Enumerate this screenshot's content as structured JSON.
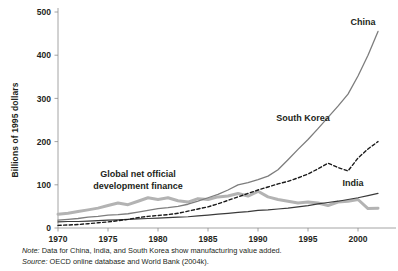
{
  "figure": {
    "axis_color": "#8d8d8d",
    "text_color": "#231f20"
  },
  "notes": {
    "note_key": "Note:",
    "note_text": " Data for China, India, and South Korea show manufacturing value added.",
    "source_key": "Source:",
    "source_text": " OECD online database and World Bank (2004k)."
  },
  "annotation": {
    "line1": "Global net official",
    "line2": "development finance"
  },
  "chart_data": {
    "type": "line",
    "title": "",
    "subtitle": "",
    "xlabel": "",
    "ylabel": "Billions of 1995 dollars",
    "xlim": [
      1970,
      2002
    ],
    "ylim": [
      0,
      500
    ],
    "yticks": [
      0,
      100,
      200,
      300,
      400,
      500
    ],
    "ytick_labels": [
      "0",
      "100",
      "200",
      "300",
      "400",
      "500"
    ],
    "xticks": [
      1970,
      1975,
      1980,
      1985,
      1990,
      1995,
      2000
    ],
    "xtick_labels": [
      "1970",
      "1975",
      "1980",
      "1985",
      "1990",
      "1995",
      "2000"
    ],
    "grid": false,
    "legend": "inline-labels",
    "x": [
      1970,
      1971,
      1972,
      1973,
      1974,
      1975,
      1976,
      1977,
      1978,
      1979,
      1980,
      1981,
      1982,
      1983,
      1984,
      1985,
      1986,
      1987,
      1988,
      1989,
      1990,
      1991,
      1992,
      1993,
      1994,
      1995,
      1996,
      1997,
      1998,
      1999,
      2000,
      2001,
      2002
    ],
    "series": [
      {
        "name": "China",
        "label": "China",
        "color": "#7d7d7d",
        "style": "solid",
        "width": 1.3,
        "label_xy": [
          2000.5,
          470
        ],
        "values": [
          18,
          20,
          22,
          25,
          27,
          30,
          31,
          33,
          37,
          41,
          45,
          47,
          50,
          55,
          62,
          70,
          78,
          88,
          100,
          105,
          112,
          120,
          135,
          158,
          182,
          205,
          230,
          256,
          282,
          310,
          352,
          400,
          455
        ]
      },
      {
        "name": "South Korea",
        "label": "South Korea",
        "color": "#1a1a1a",
        "style": "dashed",
        "width": 1.4,
        "label_xy": [
          1994.5,
          247
        ],
        "values": [
          6,
          7,
          8,
          10,
          12,
          14,
          17,
          20,
          24,
          27,
          29,
          31,
          34,
          39,
          44,
          49,
          56,
          64,
          72,
          80,
          88,
          95,
          102,
          108,
          116,
          125,
          137,
          150,
          140,
          132,
          162,
          183,
          200
        ]
      },
      {
        "name": "India",
        "label": "India",
        "color": "#3a3a3a",
        "style": "solid",
        "width": 1.2,
        "label_xy": [
          1999.5,
          98
        ],
        "values": [
          14,
          15,
          15,
          16,
          17,
          18,
          19,
          20,
          21,
          22,
          23,
          24,
          25,
          26,
          28,
          30,
          32,
          34,
          36,
          38,
          41,
          42,
          44,
          46,
          49,
          52,
          56,
          59,
          62,
          66,
          70,
          75,
          80
        ]
      },
      {
        "name": "Global net official development finance",
        "label": "Global net official development finance",
        "color": "#b3b3b3",
        "style": "solid",
        "width": 3.0,
        "label_xy": [
          1978,
          118
        ],
        "values": [
          32,
          34,
          38,
          42,
          46,
          52,
          58,
          54,
          62,
          70,
          66,
          70,
          63,
          60,
          68,
          66,
          72,
          74,
          80,
          74,
          85,
          72,
          66,
          62,
          58,
          60,
          58,
          52,
          60,
          62,
          66,
          45,
          46
        ]
      }
    ]
  }
}
